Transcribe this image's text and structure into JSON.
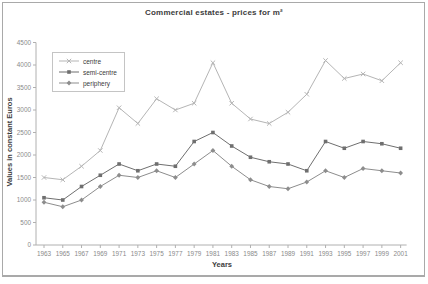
{
  "chart_data": {
    "type": "line",
    "title": "Commercial estates - prices for m²",
    "xlabel": "Years",
    "ylabel": "Values in constant Euros",
    "ylim": [
      0,
      4500
    ],
    "yticks": [
      0,
      500,
      1000,
      1500,
      2000,
      2500,
      3000,
      3500,
      4000,
      4500
    ],
    "grid": false,
    "legend_position": "top-left",
    "categories": [
      "1963",
      "1965",
      "1967",
      "1969",
      "1971",
      "1973",
      "1975",
      "1977",
      "1979",
      "1981",
      "1983",
      "1985",
      "1987",
      "1989",
      "1991",
      "1993",
      "1995",
      "1997",
      "1999",
      "2001"
    ],
    "series": [
      {
        "name": "centre",
        "marker": "x",
        "color": "#b5b5b5",
        "values": [
          1500,
          1450,
          1750,
          2100,
          3050,
          2700,
          3250,
          3000,
          3150,
          4050,
          3150,
          2800,
          2700,
          2950,
          3350,
          4100,
          3700,
          3800,
          3650,
          4050
        ]
      },
      {
        "name": "semi-centre",
        "marker": "square",
        "color": "#6f6f6f",
        "values": [
          1050,
          1000,
          1300,
          1550,
          1800,
          1650,
          1800,
          1750,
          2300,
          2500,
          2200,
          1950,
          1850,
          1800,
          1650,
          2300,
          2150,
          2300,
          2250,
          2150
        ]
      },
      {
        "name": "periphery",
        "marker": "diamond",
        "color": "#8d8d8d",
        "values": [
          950,
          850,
          1000,
          1300,
          1550,
          1500,
          1650,
          1500,
          1800,
          2100,
          1750,
          1450,
          1300,
          1250,
          1400,
          1650,
          1500,
          1700,
          1650,
          1600
        ]
      }
    ],
    "axis_color": "#b0b0b0"
  }
}
